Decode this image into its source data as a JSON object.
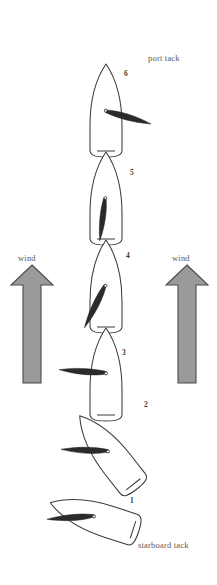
{
  "diagram": {
    "background_color": "#ffffff",
    "hull_stroke_color": "#3a3a3a",
    "sail_fill_color": "#2b2b2b",
    "wind_arrow_fill": "#9a9a9a",
    "wind_arrow_stroke": "#4a4a4a",
    "label_color": "#5a5a5a"
  },
  "labels": {
    "port_tack": "port tack",
    "starboard_tack": "starboard tack",
    "wind_left": "wind",
    "wind_right": "wind"
  },
  "wind_arrows": [
    {
      "id": "left",
      "label": "wind",
      "direction": "up"
    },
    {
      "id": "right",
      "label": "wind",
      "direction": "up"
    }
  ],
  "boats": [
    {
      "number": "1",
      "label": "1",
      "state": "starboard tack",
      "hull_rotation_deg": -72,
      "sail_angle_deg": -20,
      "description": "close-hauled on starboard tack, hull nearly horizontal pointing right"
    },
    {
      "number": "2",
      "label": "2",
      "state": "turning into the wind",
      "hull_rotation_deg": -38,
      "sail_angle_deg": -8,
      "description": "beginning the tack, bow swinging up toward the wind"
    },
    {
      "number": "3",
      "label": "3",
      "state": "luffing, sail to leeward",
      "hull_rotation_deg": -8,
      "sail_angle_deg": -6,
      "description": "sail eased out to port side, boat nearly pointing upwind"
    },
    {
      "number": "4",
      "label": "4",
      "state": "approaching head to wind",
      "hull_rotation_deg": 0,
      "sail_angle_deg": -60,
      "description": "sail swinging across, angled down-left"
    },
    {
      "number": "5",
      "label": "5",
      "state": "head to wind",
      "hull_rotation_deg": 0,
      "sail_angle_deg": -85,
      "description": "sail luffing along the centreline, boat pointing directly into the wind"
    },
    {
      "number": "6",
      "label": "6",
      "state": "port tack",
      "hull_rotation_deg": 0,
      "sail_angle_deg": 18,
      "description": "new tack filled, sail out to starboard side"
    }
  ]
}
